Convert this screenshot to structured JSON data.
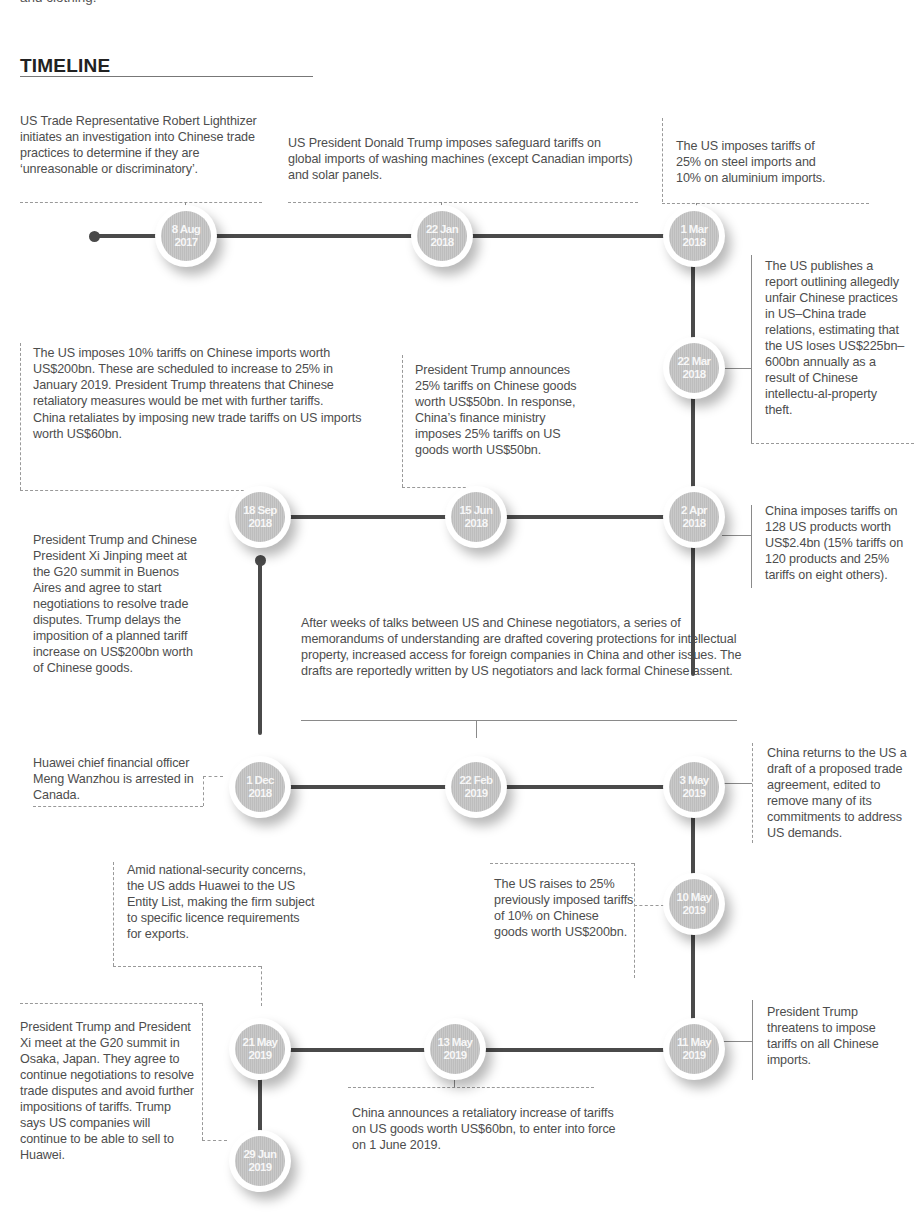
{
  "intro_fragment": "and clothing.",
  "section_title": "TIMELINE",
  "events": [
    {
      "date_line1": "8 Aug",
      "date_line2": "2017",
      "text": "US Trade Representative Robert Lighthizer initiates an investigation into Chinese trade practices to determine if they are ‘unreasonable or discriminatory’."
    },
    {
      "date_line1": "22 Jan",
      "date_line2": "2018",
      "text": "US President Donald Trump imposes safeguard tariffs on global imports of washing machines (except Canadian imports) and solar panels."
    },
    {
      "date_line1": "1 Mar",
      "date_line2": "2018",
      "text": "The US imposes tariffs of 25% on steel imports and 10% on aluminium imports."
    },
    {
      "date_line1": "22 Mar",
      "date_line2": "2018",
      "text": "The US publishes a report outlining allegedly unfair Chinese practices in US–China trade relations, estimating that the US loses US$225bn–600bn annually as a result of Chinese intellectu-al-property theft."
    },
    {
      "date_line1": "2 Apr",
      "date_line2": "2018",
      "text": "China imposes tariffs on 128 US products worth US$2.4bn (15% tariffs on 120 products and 25% tariffs on eight others)."
    },
    {
      "date_line1": "15 Jun",
      "date_line2": "2018",
      "text": "President Trump announces 25% tariffs on Chinese goods worth US$50bn. In response, China’s finance ministry imposes 25% tariffs on US goods worth US$50bn."
    },
    {
      "date_line1": "18 Sep",
      "date_line2": "2018",
      "text": "The US imposes 10% tariffs on Chinese imports worth US$200bn. These are scheduled to increase to 25% in January 2019. President Trump threatens that Chinese retaliatory measures would be met with further tariffs.",
      "text2": "China retaliates by imposing new trade tariffs on US imports worth US$60bn."
    },
    {
      "date_line1": "1 Dec",
      "date_line2": "2018",
      "text": "President Trump and Chinese President Xi Jinping meet at the G20 summit in Buenos Aires and agree to start negotiations to resolve trade disputes. Trump delays the imposition of a planned tariff increase on US$200bn worth of Chinese goods.",
      "text2": "Huawei chief financial officer Meng Wanzhou is arrested in Canada."
    },
    {
      "date_line1": "22 Feb",
      "date_line2": "2019",
      "text": "After weeks of talks between US and Chinese negotiators, a series of memorandums of understanding are drafted covering protections for intellectual property, increased access for foreign companies in China and other issues. The drafts are reportedly written by US negotiators and lack formal Chinese assent."
    },
    {
      "date_line1": "3 May",
      "date_line2": "2019",
      "text": "China returns to the US a draft of a proposed trade agreement, edited to remove many of its commitments to address US demands."
    },
    {
      "date_line1": "10 May",
      "date_line2": "2019",
      "text": "The US raises to 25% previously imposed tariffs of 10% on Chinese goods worth US$200bn."
    },
    {
      "date_line1": "11 May",
      "date_line2": "2019",
      "text": "President Trump threatens to impose tariffs on all Chinese imports."
    },
    {
      "date_line1": "13 May",
      "date_line2": "2019",
      "text": "China announces a retaliatory increase of tariffs on US goods worth US$60bn, to enter into force on 1 June 2019."
    },
    {
      "date_line1": "21 May",
      "date_line2": "2019",
      "text": "Amid national-security concerns, the US adds Huawei to the US Entity List, making the firm subject to specific licence requirements for exports."
    },
    {
      "date_line1": "29 Jun",
      "date_line2": "2019",
      "text": "President Trump and President Xi meet at the G20 summit in Osaka, Japan. They agree to continue negotiations to resolve trade disputes and avoid further impositions of tariffs. Trump says US companies will continue to be able to sell to Huawei."
    }
  ]
}
